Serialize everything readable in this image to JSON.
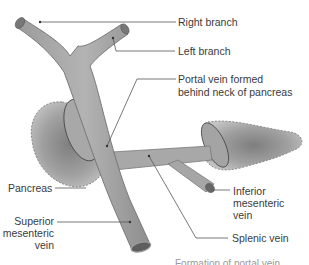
{
  "figure": {
    "colors": {
      "vein_fill": "#a9a9a9",
      "vein_shade": "#8c8c8c",
      "vein_outline": "#6e6e6e",
      "pancreas_fill": "#9a9a9a",
      "pancreas_light": "#c8c8c8",
      "leader_line": "#555555",
      "label_text": "#3a3a3a"
    },
    "labels": {
      "right_branch": "Right branch",
      "left_branch": "Left branch",
      "portal_vein_line1": "Portal vein formed",
      "portal_vein_line2": "behind neck of pancreas",
      "pancreas": "Pancreas",
      "smv_line1": "Superior",
      "smv_line2": "mesenteric",
      "smv_line3": "vein",
      "imv_line1": "Inferior",
      "imv_line2": "mesenteric",
      "imv_line3": "vein",
      "splenic_vein": "Splenic vein"
    },
    "caption_cut_off": "Formation of portal vein"
  }
}
